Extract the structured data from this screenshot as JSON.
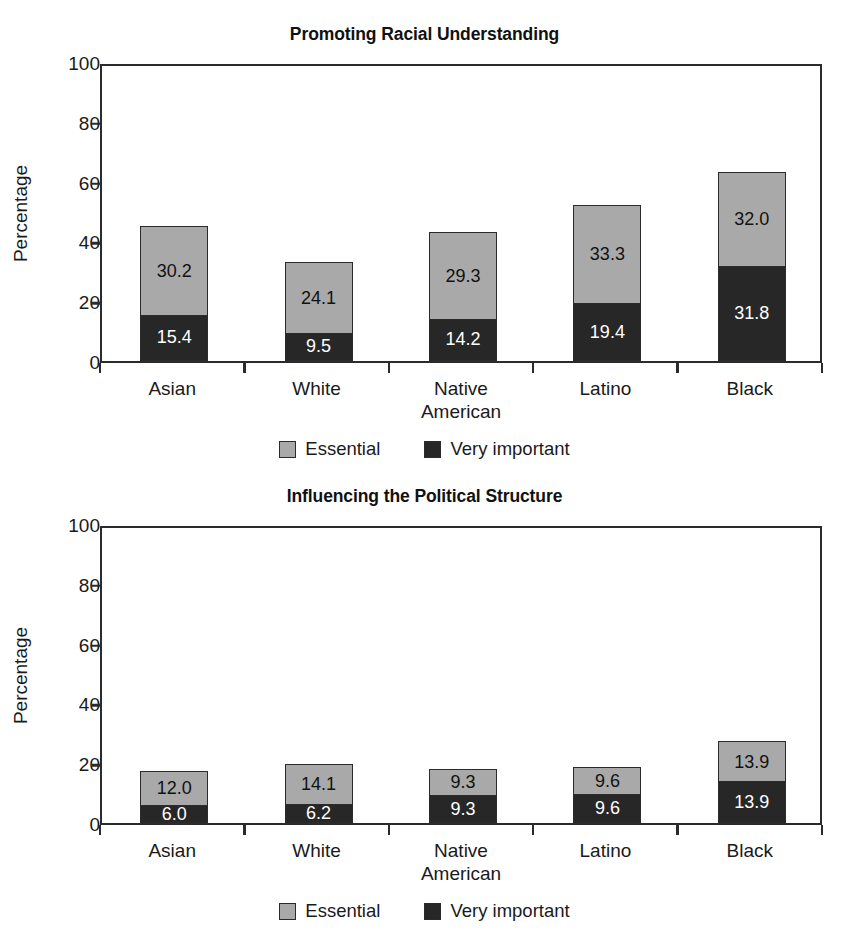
{
  "page": {
    "background": "#ffffff",
    "width": 849,
    "height": 932
  },
  "colors": {
    "essential": "#a9a9a9",
    "very_important": "#272727",
    "axis": "#2b2b2b",
    "text": "#1a1a1a"
  },
  "legend": {
    "items": [
      {
        "label": "Essential",
        "color": "#a9a9a9"
      },
      {
        "label": "Very important",
        "color": "#272727"
      }
    ]
  },
  "chart_data": [
    {
      "type": "bar",
      "stacked": true,
      "title": "Promoting Racial Understanding",
      "xlabel": "",
      "ylabel": "Percentage",
      "ylim": [
        0,
        100
      ],
      "yticks": [
        0,
        20,
        40,
        60,
        80,
        100
      ],
      "ytick_labels": [
        "0",
        "20",
        "40",
        "60",
        "80",
        "100"
      ],
      "grid": false,
      "legend_position": "bottom",
      "categories": [
        "Asian",
        "White",
        "Native American",
        "Latino",
        "Black"
      ],
      "category_lines": [
        [
          "Asian"
        ],
        [
          "White"
        ],
        [
          "Native",
          "American"
        ],
        [
          "Latino"
        ],
        [
          "Black"
        ]
      ],
      "series": [
        {
          "name": "Very important",
          "color": "#272727",
          "values": [
            15.4,
            9.5,
            14.2,
            19.4,
            31.8
          ],
          "labels": [
            "15.4",
            "9.5",
            "14.2",
            "19.4",
            "31.8"
          ]
        },
        {
          "name": "Essential",
          "color": "#a9a9a9",
          "values": [
            30.2,
            24.1,
            29.3,
            33.3,
            32.0
          ],
          "labels": [
            "30.2",
            "24.1",
            "29.3",
            "33.3",
            "32.0"
          ]
        }
      ],
      "totals": [
        45.6,
        33.6,
        43.5,
        52.7,
        63.8
      ]
    },
    {
      "type": "bar",
      "stacked": true,
      "title": "Influencing the Political Structure",
      "xlabel": "",
      "ylabel": "Percentage",
      "ylim": [
        0,
        100
      ],
      "yticks": [
        0,
        20,
        40,
        60,
        80,
        100
      ],
      "ytick_labels": [
        "0",
        "20",
        "40",
        "60",
        "80",
        "100"
      ],
      "grid": false,
      "legend_position": "bottom",
      "categories": [
        "Asian",
        "White",
        "Native American",
        "Latino",
        "Black"
      ],
      "category_lines": [
        [
          "Asian"
        ],
        [
          "White"
        ],
        [
          "Native",
          "American"
        ],
        [
          "Latino"
        ],
        [
          "Black"
        ]
      ],
      "series": [
        {
          "name": "Very important",
          "color": "#272727",
          "values": [
            6.0,
            6.2,
            9.3,
            9.6,
            13.9
          ],
          "labels": [
            "6.0",
            "6.2",
            "9.3",
            "9.6",
            "13.9"
          ]
        },
        {
          "name": "Essential",
          "color": "#a9a9a9",
          "values": [
            12.0,
            14.1,
            9.3,
            9.6,
            13.9
          ],
          "labels": [
            "12.0",
            "14.1",
            "9.3",
            "9.6",
            "13.9"
          ]
        }
      ],
      "totals": [
        18.0,
        20.3,
        18.6,
        19.2,
        27.8
      ]
    }
  ]
}
